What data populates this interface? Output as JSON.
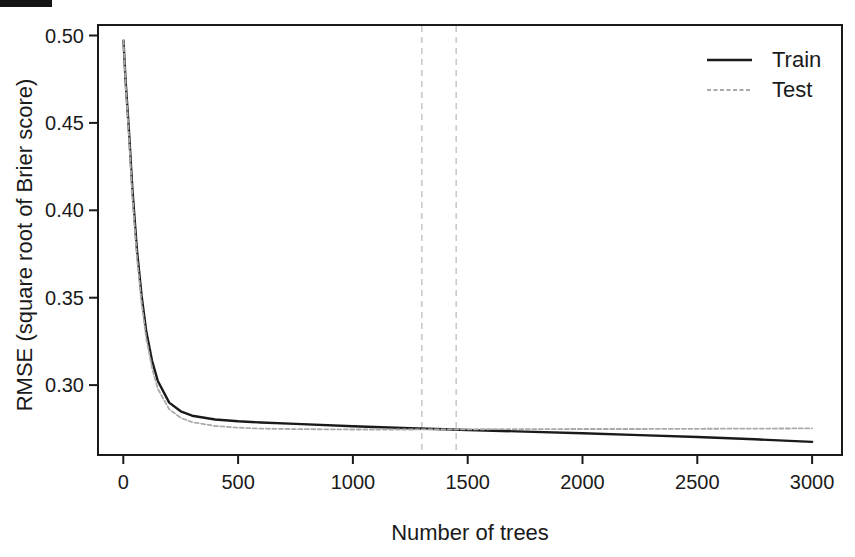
{
  "figure": {
    "background": "#ffffff",
    "text_color": "#1a1a1a"
  },
  "chart_data": {
    "type": "line",
    "title": "",
    "xlabel": "Number of trees",
    "ylabel": "RMSE (square root of Brier score)",
    "xlim": [
      -110,
      3130
    ],
    "ylim": [
      0.26,
      0.506
    ],
    "grid": false,
    "axis_color": "#1a1a1a",
    "xticks": [
      0,
      500,
      1000,
      1500,
      2000,
      2500,
      3000
    ],
    "xtick_labels": [
      "0",
      "500",
      "1000",
      "1500",
      "2000",
      "2500",
      "3000"
    ],
    "yticks": [
      0.3,
      0.35,
      0.4,
      0.45,
      0.5
    ],
    "ytick_labels": [
      "0.30",
      "0.35",
      "0.40",
      "0.45",
      "0.50"
    ],
    "legend": {
      "position": "top-right",
      "entries": [
        {
          "label": "Train",
          "color": "#1a1a1a",
          "dash": null
        },
        {
          "label": "Test",
          "color": "#aaaaaa",
          "dash": [
            4,
            2.5
          ]
        }
      ]
    },
    "vlines": [
      {
        "x": 1300,
        "color": "#c9c9c9",
        "dash": [
          6,
          5
        ]
      },
      {
        "x": 1450,
        "color": "#c9c9c9",
        "dash": [
          6,
          5
        ]
      }
    ],
    "series": [
      {
        "name": "Train",
        "color": "#1a1a1a",
        "width": 2.4,
        "dash": null,
        "x": [
          1,
          10,
          25,
          40,
          60,
          80,
          100,
          125,
          150,
          200,
          250,
          300,
          400,
          500,
          600,
          750,
          1000,
          1250,
          1400,
          1500,
          1750,
          2000,
          2250,
          2500,
          2750,
          3000
        ],
        "y": [
          0.497,
          0.474,
          0.445,
          0.412,
          0.377,
          0.351,
          0.331,
          0.314,
          0.3025,
          0.29,
          0.285,
          0.2825,
          0.2803,
          0.2793,
          0.2786,
          0.2778,
          0.2764,
          0.2753,
          0.2747,
          0.2743,
          0.2734,
          0.2724,
          0.2714,
          0.2703,
          0.269,
          0.2675
        ]
      },
      {
        "name": "Test",
        "color": "#aaaaaa",
        "width": 1.8,
        "dash": [
          4,
          2.5
        ],
        "x": [
          1,
          10,
          25,
          40,
          60,
          80,
          100,
          125,
          150,
          200,
          250,
          300,
          400,
          500,
          600,
          750,
          1000,
          1250,
          1400,
          1500,
          1750,
          2000,
          2250,
          2500,
          2750,
          3000
        ],
        "y": [
          0.497,
          0.472,
          0.442,
          0.408,
          0.373,
          0.347,
          0.327,
          0.31,
          0.298,
          0.2862,
          0.2812,
          0.2788,
          0.2766,
          0.2756,
          0.2751,
          0.2748,
          0.2746,
          0.2746,
          0.2747,
          0.2747,
          0.2748,
          0.2749,
          0.2749,
          0.275,
          0.2751,
          0.2752
        ]
      }
    ]
  }
}
